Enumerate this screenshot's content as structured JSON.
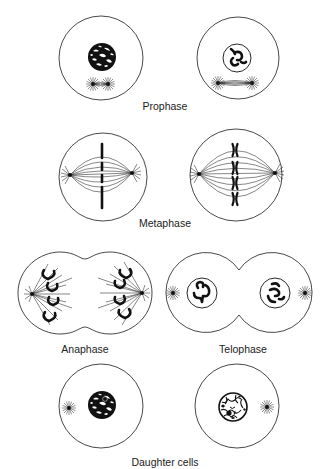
{
  "figure": {
    "stages": [
      {
        "id": "prophase",
        "label": "Prophase",
        "cells": 2
      },
      {
        "id": "metaphase",
        "label": "Metaphase",
        "cells": 2
      },
      {
        "id": "anaphase",
        "label": "Anaphase",
        "cells": 1
      },
      {
        "id": "telophase",
        "label": "Telophase",
        "cells": 1
      },
      {
        "id": "daughter-cells",
        "label": "Daughter cells",
        "cells": 2
      }
    ]
  },
  "labels": {
    "prophase": "Prophase",
    "metaphase": "Metaphase",
    "anaphase": "Anaphase",
    "telophase": "Telophase",
    "daughter_cells": "Daughter cells"
  },
  "colors": {
    "background": "#ffffff",
    "ink": "#111111"
  }
}
